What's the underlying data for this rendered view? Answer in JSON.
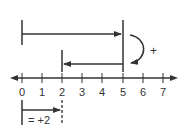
{
  "diagram": {
    "type": "number-line-addition",
    "number_line": {
      "ticks": [
        "0",
        "1",
        "2",
        "3",
        "4",
        "5",
        "6",
        "7"
      ],
      "arrows_both_ends": true
    },
    "first_jump": {
      "from": 0,
      "to": 5,
      "direction": "right"
    },
    "second_jump": {
      "from": 5,
      "to": 2,
      "direction": "left"
    },
    "operation_symbol": "+",
    "result": {
      "from": 0,
      "to": 2,
      "label": "= +2"
    },
    "colors": {
      "ink": "#333333",
      "background": "#ffffff"
    }
  }
}
